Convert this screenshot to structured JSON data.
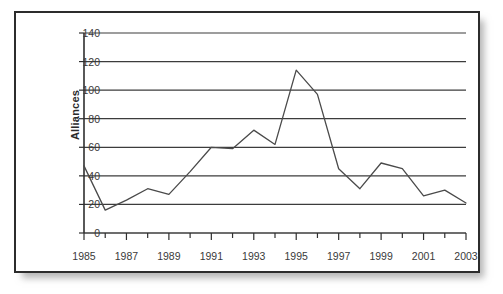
{
  "figure": {
    "kind": "line-chart-figure",
    "border_color": "#2c2c2c",
    "background": "#ffffff",
    "line_color": "#4a4a4a",
    "grid_color": "#3c3c3c",
    "axis_color": "#2f2f2f"
  },
  "chart_data": {
    "type": "line",
    "title": "",
    "xlabel": "",
    "ylabel": "Alliances",
    "xlim": [
      1985,
      2003
    ],
    "ylim": [
      0,
      140
    ],
    "ytick_values": [
      0,
      20,
      40,
      60,
      80,
      100,
      120,
      140
    ],
    "ytick_labels": [
      "0",
      "20",
      "40",
      "60",
      "80",
      "100",
      "120",
      "140"
    ],
    "xtick_values": [
      1985,
      1987,
      1989,
      1991,
      1993,
      1995,
      1997,
      1999,
      2001,
      2003
    ],
    "xtick_labels": [
      "1985",
      "1987",
      "1989",
      "1991",
      "1993",
      "1995",
      "1997",
      "1999",
      "2001",
      "2003"
    ],
    "minor_xticks": [
      1986,
      1988,
      1990,
      1992,
      1994,
      1996,
      1998,
      2000,
      2002
    ],
    "grid": "horizontal",
    "legend": "none",
    "x": [
      1985,
      1986,
      1987,
      1988,
      1989,
      1990,
      1991,
      1992,
      1993,
      1994,
      1995,
      1996,
      1997,
      1998,
      1999,
      2000,
      2001,
      2002,
      2003
    ],
    "values": [
      47,
      16,
      23,
      31,
      27,
      43,
      60,
      59,
      72,
      62,
      114,
      97,
      45,
      31,
      49,
      45,
      26,
      30,
      21
    ],
    "series": [
      {
        "name": "Alliances",
        "values": [
          47,
          16,
          23,
          31,
          27,
          43,
          60,
          59,
          72,
          62,
          114,
          97,
          45,
          31,
          49,
          45,
          26,
          30,
          21
        ]
      }
    ]
  }
}
